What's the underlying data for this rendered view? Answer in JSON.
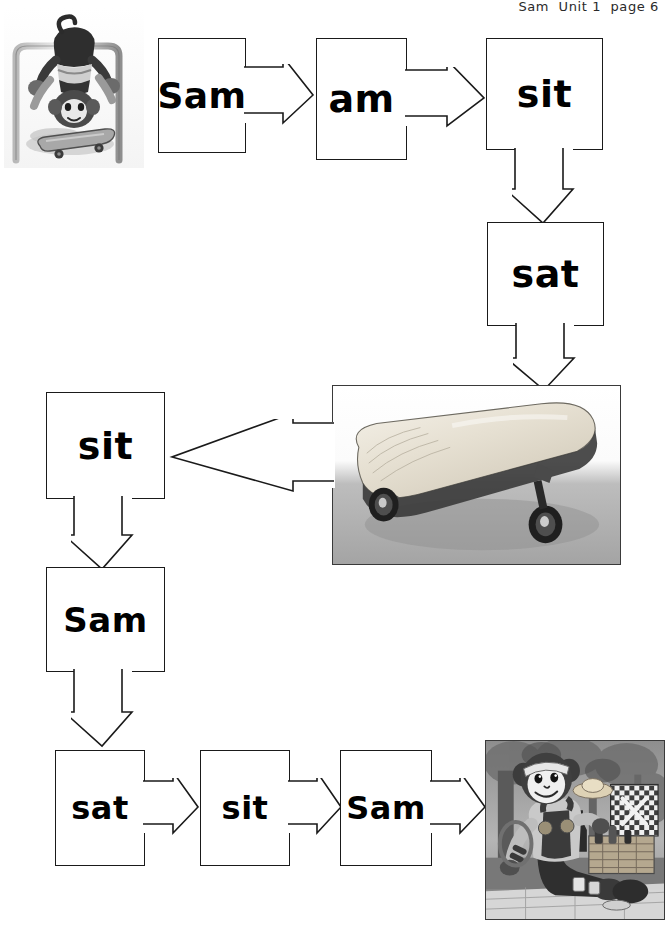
{
  "page": {
    "width": 671,
    "height": 926,
    "background": "#ffffff",
    "ink": "#1a1a1a"
  },
  "header": {
    "text": "Sam  Unit 1  page 6",
    "title_word": "Sam",
    "unit_label": "Unit 1",
    "page_label": "page 6"
  },
  "worksheet": {
    "kind": "phonics word-path flow chart",
    "word_cards": [
      {
        "id": "card-sam-1",
        "word": "Sam",
        "row": 1,
        "x": 158,
        "y": 38,
        "w": 88,
        "h": 115,
        "font_size": 36,
        "arrow": "right"
      },
      {
        "id": "card-am",
        "word": "am",
        "row": 1,
        "x": 316,
        "y": 38,
        "w": 91,
        "h": 122,
        "font_size": 38,
        "arrow": "right"
      },
      {
        "id": "card-sit-1",
        "word": "sit",
        "row": 1,
        "x": 486,
        "y": 38,
        "w": 117,
        "h": 112,
        "font_size": 38,
        "arrow": "down"
      },
      {
        "id": "card-sat-1",
        "word": "sat",
        "row": 2,
        "x": 487,
        "y": 222,
        "w": 117,
        "h": 104,
        "font_size": 38,
        "arrow": "down"
      },
      {
        "id": "card-sit-2",
        "word": "sit",
        "row": 3,
        "x": 46,
        "y": 392,
        "w": 119,
        "h": 107,
        "font_size": 38,
        "arrow": "down"
      },
      {
        "id": "card-sam-2",
        "word": "Sam",
        "row": 4,
        "x": 46,
        "y": 567,
        "w": 119,
        "h": 105,
        "font_size": 34,
        "arrow": "down"
      },
      {
        "id": "card-sat-2",
        "word": "sat",
        "row": 5,
        "x": 55,
        "y": 750,
        "w": 90,
        "h": 116,
        "font_size": 32,
        "arrow": "right"
      },
      {
        "id": "card-sit-3",
        "word": "sit",
        "row": 5,
        "x": 200,
        "y": 750,
        "w": 90,
        "h": 116,
        "font_size": 32,
        "arrow": "right"
      },
      {
        "id": "card-sam-3",
        "word": "Sam",
        "row": 5,
        "x": 340,
        "y": 750,
        "w": 92,
        "h": 116,
        "font_size": 32,
        "arrow": "right"
      }
    ],
    "connector_arrows": [
      {
        "id": "arrow-sam1-to-am",
        "direction": "right",
        "from": "card-sam-1",
        "to": "card-am"
      },
      {
        "id": "arrow-am-to-sit1",
        "direction": "right",
        "from": "card-am",
        "to": "card-sit-1"
      },
      {
        "id": "arrow-sit1-to-sat1",
        "direction": "down",
        "from": "card-sit-1",
        "to": "card-sat-1"
      },
      {
        "id": "arrow-sat1-to-photo",
        "direction": "down",
        "from": "card-sat-1",
        "to": "photo-skateboard"
      },
      {
        "id": "arrow-photo-to-sit2",
        "direction": "left",
        "from": "photo-skateboard",
        "to": "card-sit-2"
      },
      {
        "id": "arrow-sit2-to-sam2",
        "direction": "down",
        "from": "card-sit-2",
        "to": "card-sam-2"
      },
      {
        "id": "arrow-sam2-to-sat2",
        "direction": "down",
        "from": "card-sam-2",
        "to": "card-sat-2"
      },
      {
        "id": "arrow-sat2-to-sit3",
        "direction": "right",
        "from": "card-sat-2",
        "to": "card-sit-3"
      },
      {
        "id": "arrow-sit3-to-sam3",
        "direction": "right",
        "from": "card-sit-3",
        "to": "card-sam-3"
      },
      {
        "id": "arrow-sam3-to-photo",
        "direction": "right",
        "from": "card-sam-3",
        "to": "photo-picnic"
      }
    ],
    "photos": [
      {
        "id": "photo-monkey-railing",
        "alt": "Monkey toy hanging upside down from a metal railing with a skateboard below",
        "framed": false,
        "x": 4,
        "y": 8,
        "w": 140,
        "h": 160
      },
      {
        "id": "photo-skateboard",
        "alt": "Wooden skateboard photograph",
        "framed": true,
        "x": 332,
        "y": 385,
        "w": 289,
        "h": 180
      },
      {
        "id": "photo-picnic",
        "alt": "Monkey character sitting at a picnic with a hamper and blanket",
        "framed": true,
        "x": 485,
        "y": 740,
        "w": 180,
        "h": 180
      }
    ]
  }
}
